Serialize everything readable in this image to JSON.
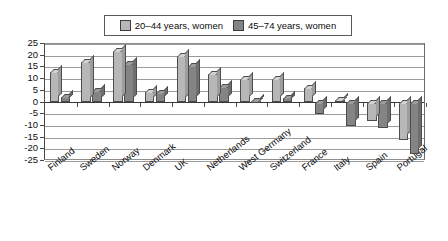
{
  "chart_data": {
    "type": "bar",
    "title": "",
    "subtitle": "",
    "xlabel": "",
    "ylabel": "",
    "ylim": [
      -25,
      25
    ],
    "ytick_step": 5,
    "yticks": [
      "25",
      "20",
      "15",
      "10",
      "5",
      "0",
      "-5",
      "-10",
      "-15",
      "-20",
      "-25"
    ],
    "grid": true,
    "legend_position": "top-center",
    "categories": [
      "Finland",
      "Sweden",
      "Norway",
      "Denmark",
      "UK",
      "Netherlands",
      "West Germany",
      "Switzerland",
      "France",
      "Italy",
      "Spain",
      "Portugal"
    ],
    "series": [
      {
        "name": "20-44 years, women",
        "color": "#b7b7b7",
        "values": [
          13,
          17.5,
          22,
          4.5,
          20,
          12,
          10,
          10,
          6,
          1,
          -8,
          -16
        ]
      },
      {
        "name": "45-74 years, women",
        "color": "#848484",
        "values": [
          2.5,
          5,
          16.5,
          4,
          15.5,
          6.5,
          0.5,
          2,
          -5,
          -10,
          -11,
          -22
        ]
      }
    ]
  },
  "legend": {
    "entries": [
      {
        "label": "20–44 years, women",
        "swatch": "#b7b7b7"
      },
      {
        "label": "45–74 years, women",
        "swatch": "#848484"
      }
    ]
  }
}
